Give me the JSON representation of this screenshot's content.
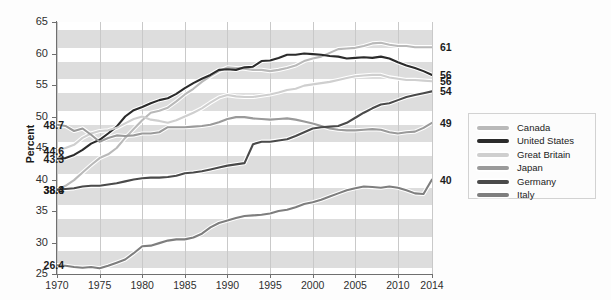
{
  "axes": {
    "y_title": "Percent",
    "y_ticks": [
      25,
      30,
      35,
      40,
      45,
      50,
      55,
      60,
      65
    ],
    "x_ticks": [
      "1970",
      "1975",
      "1980",
      "1985",
      "1990",
      "1995",
      "2000",
      "2005",
      "2010",
      "2014"
    ]
  },
  "legend": {
    "items": [
      {
        "label": "Canada",
        "color": "#b9b9b9"
      },
      {
        "label": "United States",
        "color": "#2b2b2b"
      },
      {
        "label": "Great Britain",
        "color": "#cfcfcf"
      },
      {
        "label": "Japan",
        "color": "#9a9a9a"
      },
      {
        "label": "Germany",
        "color": "#4a4a4a"
      },
      {
        "label": "Italy",
        "color": "#7e7e7e"
      }
    ]
  },
  "start_labels": [
    {
      "text": "48.7",
      "value": 48.7
    },
    {
      "text": "44.6",
      "value": 44.6
    },
    {
      "text": "43.3",
      "value": 43.3
    },
    {
      "text": "38.4",
      "value": 38.4
    },
    {
      "text": "38.3",
      "value": 38.3
    },
    {
      "text": "26.4",
      "value": 26.4
    }
  ],
  "end_labels": [
    {
      "text": "61",
      "value": 61
    },
    {
      "text": "56",
      "value": 56.6
    },
    {
      "text": "56",
      "value": 55.6
    },
    {
      "text": "54",
      "value": 54
    },
    {
      "text": "49",
      "value": 49
    },
    {
      "text": "40",
      "value": 40
    }
  ],
  "chart_data": {
    "type": "line",
    "title": "",
    "subtitle": "",
    "xlabel": "",
    "ylabel": "Percent",
    "xlim": [
      1970,
      2014
    ],
    "ylim": [
      25,
      65
    ],
    "grid": "vertical-gridlines-plus-alternating-horizontal-bands",
    "legend_position": "right",
    "x": [
      1970,
      1971,
      1972,
      1973,
      1974,
      1975,
      1976,
      1977,
      1978,
      1979,
      1980,
      1981,
      1982,
      1983,
      1984,
      1985,
      1986,
      1987,
      1988,
      1989,
      1990,
      1991,
      1992,
      1993,
      1994,
      1995,
      1996,
      1997,
      1998,
      1999,
      2000,
      2001,
      2002,
      2003,
      2004,
      2005,
      2006,
      2007,
      2008,
      2009,
      2010,
      2011,
      2012,
      2013,
      2014
    ],
    "series": [
      {
        "name": "Canada",
        "color": "#b9b9b9",
        "start_value": 38.3,
        "end_value": 61,
        "values": [
          38.3,
          39.0,
          39.9,
          41.1,
          42.3,
          43.4,
          44.0,
          45.0,
          46.6,
          48.0,
          49.4,
          50.6,
          50.9,
          51.4,
          52.4,
          53.5,
          54.4,
          55.5,
          56.4,
          57.2,
          57.8,
          57.7,
          57.6,
          57.4,
          57.4,
          57.2,
          57.4,
          57.7,
          58.1,
          58.8,
          59.2,
          59.5,
          60.1,
          60.7,
          60.8,
          60.9,
          61.2,
          61.6,
          61.7,
          61.4,
          61.2,
          61.2,
          61.0,
          61.0,
          61.0
        ]
      },
      {
        "name": "United States",
        "color": "#2b2b2b",
        "start_value": 43.3,
        "end_value": 56.6,
        "values": [
          43.3,
          43.4,
          43.9,
          44.7,
          45.7,
          46.3,
          47.3,
          48.4,
          50.0,
          51.0,
          51.5,
          52.1,
          52.6,
          52.9,
          53.6,
          54.5,
          55.3,
          56.0,
          56.6,
          57.4,
          57.5,
          57.4,
          57.8,
          57.9,
          58.8,
          58.9,
          59.3,
          59.8,
          59.8,
          60.0,
          59.9,
          59.8,
          59.6,
          59.5,
          59.2,
          59.3,
          59.4,
          59.3,
          59.5,
          59.2,
          58.6,
          58.1,
          57.7,
          57.2,
          56.6
        ]
      },
      {
        "name": "Great Britain",
        "color": "#cfcfcf",
        "start_value": 44.6,
        "end_value": 55.6,
        "values": [
          44.6,
          45.0,
          45.5,
          46.6,
          47.3,
          47.7,
          47.8,
          48.2,
          48.9,
          49.6,
          50.0,
          49.5,
          49.3,
          49.0,
          49.4,
          50.0,
          50.6,
          51.3,
          52.2,
          53.0,
          53.4,
          53.2,
          53.1,
          53.1,
          53.3,
          53.5,
          53.8,
          54.2,
          54.4,
          54.9,
          55.1,
          55.3,
          55.5,
          55.8,
          56.1,
          56.4,
          56.5,
          56.6,
          56.6,
          56.2,
          56.0,
          55.8,
          55.8,
          55.7,
          55.6
        ]
      },
      {
        "name": "Japan",
        "color": "#9a9a9a",
        "start_value": 48.7,
        "end_value": 49,
        "values": [
          48.7,
          48.5,
          47.7,
          48.1,
          47.1,
          46.0,
          46.6,
          47.0,
          46.9,
          47.0,
          47.3,
          47.3,
          47.5,
          48.3,
          48.3,
          48.3,
          48.4,
          48.5,
          48.7,
          49.1,
          49.6,
          49.9,
          49.9,
          49.7,
          49.6,
          49.5,
          49.6,
          49.7,
          49.5,
          49.2,
          48.9,
          48.5,
          48.1,
          47.9,
          47.8,
          47.8,
          47.9,
          48.0,
          47.9,
          47.5,
          47.3,
          47.5,
          47.6,
          48.2,
          49.0
        ]
      },
      {
        "name": "Germany",
        "color": "#4a4a4a",
        "start_value": 38.4,
        "end_value": 54,
        "values": [
          38.4,
          38.5,
          38.6,
          38.9,
          39.0,
          39.0,
          39.2,
          39.4,
          39.7,
          40.0,
          40.2,
          40.3,
          40.3,
          40.4,
          40.6,
          41.0,
          41.1,
          41.3,
          41.6,
          41.9,
          42.2,
          42.4,
          42.6,
          45.6,
          46.0,
          46.0,
          46.2,
          46.4,
          46.9,
          47.5,
          48.1,
          48.3,
          48.4,
          48.5,
          49.0,
          49.8,
          50.6,
          51.3,
          51.9,
          52.1,
          52.6,
          53.1,
          53.4,
          53.7,
          54.0
        ]
      },
      {
        "name": "Italy",
        "color": "#7e7e7e",
        "start_value": 26.4,
        "end_value": 40,
        "values": [
          26.4,
          26.3,
          26.1,
          26.0,
          26.1,
          25.9,
          26.3,
          26.8,
          27.3,
          28.3,
          29.4,
          29.5,
          29.9,
          30.3,
          30.5,
          30.5,
          30.8,
          31.4,
          32.4,
          33.1,
          33.5,
          33.9,
          34.2,
          34.3,
          34.4,
          34.6,
          35.0,
          35.2,
          35.6,
          36.1,
          36.4,
          36.8,
          37.3,
          37.8,
          38.3,
          38.6,
          38.9,
          38.8,
          38.7,
          38.9,
          38.7,
          38.3,
          37.8,
          37.7,
          40.0
        ]
      }
    ]
  }
}
